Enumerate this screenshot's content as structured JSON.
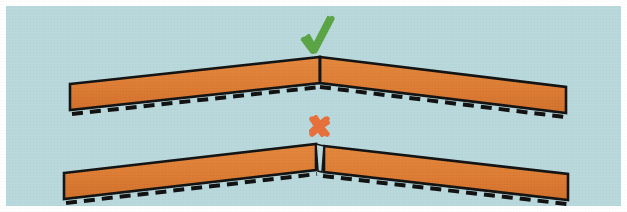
{
  "figure": {
    "colors": {
      "background": "#b9d9dd",
      "page": "#ffffff",
      "beam_fill": "#de7c33",
      "beam_fill_shadow": "#c96a24",
      "outline": "#121212",
      "dashed_line": "#101010",
      "check_mark": "#5aa545",
      "cross_mark": "#e8703a"
    },
    "border": {
      "color": "#ffffff",
      "width_px": 6
    }
  },
  "marks": [
    {
      "id": "check",
      "glyph": "check-mark",
      "label": "Correct",
      "color": "#5aa545",
      "x": 318,
      "y": 38
    },
    {
      "id": "cross",
      "glyph": "cross-mark",
      "label": "Incorrect",
      "color": "#e8703a",
      "x": 318,
      "y": 124
    }
  ],
  "assemblies": [
    {
      "id": "upper",
      "status": "correct",
      "status_mark": "check-mark",
      "joint_type": "tight-butt-joint",
      "joint_gap_px": 0,
      "apex_x": 320,
      "apex_y": 57,
      "left_end_x": 70,
      "left_end_top_y": 84,
      "right_end_x": 566,
      "right_end_top_y": 87,
      "beam_thickness_px": 26,
      "dashed_reference_line": true
    },
    {
      "id": "lower",
      "status": "incorrect",
      "status_mark": "cross-mark",
      "joint_type": "open-v-gap-joint",
      "joint_gap_px": 7,
      "apex_x": 320,
      "apex_y": 144,
      "left_end_x": 64,
      "left_end_top_y": 173,
      "right_end_x": 568,
      "right_end_top_y": 174,
      "beam_thickness_px": 26,
      "dashed_reference_line": true
    }
  ],
  "geometry": {
    "upper": {
      "left_beam_outline": "70,84 320,57 320,83 70,110",
      "right_beam_outline": "320,57 566,87 566,113 320,83",
      "left_dash_path": "M 72,113 L 320,86",
      "right_dash_path": "M 320,86 L 564,116"
    },
    "lower": {
      "left_beam_outline": "64,173 316,144 316,170 64,199",
      "right_beam_outline": "324,146 568,174 568,200 324,172",
      "left_dash_path": "M 66,202 L 317,173",
      "right_dash_path": "M 323,175 L 566,203"
    }
  },
  "dash_pattern": {
    "dash_px": 11,
    "gap_px": 7,
    "stroke_width_px": 4
  }
}
